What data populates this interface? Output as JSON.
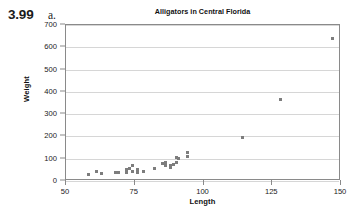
{
  "exercise": {
    "number": "3.99",
    "part": "a."
  },
  "chart_data": {
    "type": "scatter",
    "title": "Alligators in Central Florida",
    "xlabel": "Length",
    "ylabel": "Weight",
    "xlim": [
      50,
      150
    ],
    "ylim": [
      0,
      700
    ],
    "xticks": [
      50,
      75,
      100,
      125,
      150
    ],
    "yticks": [
      0,
      100,
      200,
      300,
      400,
      500,
      600,
      700
    ],
    "grid": "horizontal",
    "legend": "none",
    "marker": {
      "shape": "square",
      "color": "#7d7d7d",
      "size_px": 3
    },
    "series": [
      {
        "name": "Alligators",
        "points": [
          [
            58,
            28
          ],
          [
            61,
            44
          ],
          [
            63,
            33
          ],
          [
            68,
            39
          ],
          [
            69,
            36
          ],
          [
            72,
            38
          ],
          [
            72,
            51
          ],
          [
            73,
            57
          ],
          [
            74,
            42
          ],
          [
            74,
            70
          ],
          [
            76,
            50
          ],
          [
            76,
            40
          ],
          [
            78,
            43
          ],
          [
            82,
            55
          ],
          [
            85,
            80
          ],
          [
            86,
            84
          ],
          [
            86,
            70
          ],
          [
            86,
            83
          ],
          [
            88,
            70
          ],
          [
            88,
            61
          ],
          [
            89,
            72
          ],
          [
            90,
            106
          ],
          [
            90,
            84
          ],
          [
            91,
            100
          ],
          [
            94,
            110
          ],
          [
            94,
            130
          ],
          [
            114,
            197
          ],
          [
            128,
            366
          ],
          [
            147,
            640
          ]
        ]
      }
    ]
  }
}
